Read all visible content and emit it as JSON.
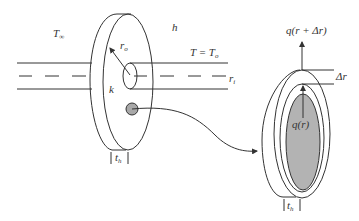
{
  "diagram": {
    "type": "annular fin on pipe with differential ring element",
    "colors": {
      "line": "#333333",
      "shaded": "#b3b3b3",
      "background": "#ffffff"
    },
    "labels": {
      "ambient_temp": "T",
      "ambient_temp_sub": "∞",
      "convection_coeff": "h",
      "outer_radius": "r",
      "outer_radius_sub": "o",
      "inner_radius": "r",
      "inner_radius_sub": "i",
      "base_temp": "T = T",
      "base_temp_sub": "o",
      "conductivity": "k",
      "thickness": "t",
      "thickness_sub": "h",
      "thickness_element": "t",
      "thickness_element_sub": "h",
      "heat_out": "q(r + Δr)",
      "heat_in": "q(r)",
      "delta_r": "Δr"
    }
  }
}
